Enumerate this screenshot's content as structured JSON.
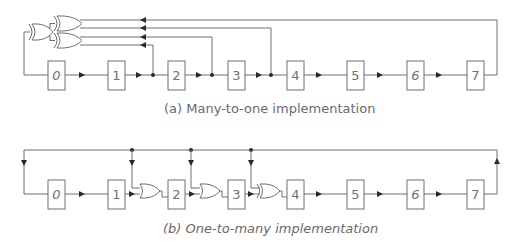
{
  "diagram": {
    "type": "lfsr-implementations",
    "colors": {
      "wire": "#6e6e6e",
      "arrow": "#2a2a2a",
      "text": "#6a6a6a",
      "background": "#ffffff"
    },
    "panel_a": {
      "caption": "(a) Many-to-one implementation",
      "registers": [
        "0",
        "1",
        "2",
        "3",
        "4",
        "5",
        "6",
        "7"
      ],
      "italic_labels": [
        "0",
        "6"
      ],
      "taps_from_outputs_of": [
        "1",
        "2",
        "3",
        "7"
      ],
      "gates": "three XOR gates in a tree feeding register 0"
    },
    "panel_b": {
      "caption": "(b) One-to-many implementation",
      "registers": [
        "0",
        "1",
        "2",
        "3",
        "4",
        "5",
        "6",
        "7"
      ],
      "italic_labels": [
        "0",
        "6"
      ],
      "xor_after_registers": [
        "1",
        "2",
        "3"
      ],
      "feedback_from": "7"
    }
  }
}
